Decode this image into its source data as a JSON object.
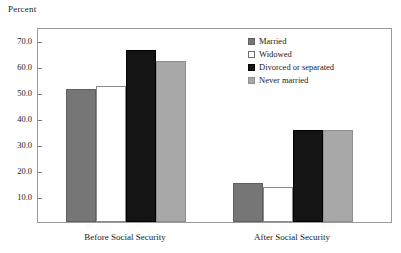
{
  "chart_data": {
    "type": "bar",
    "title": "",
    "xlabel": "",
    "ylabel": "Percent",
    "ylim": [
      0,
      75
    ],
    "yticks": [
      "10.0",
      "20.0",
      "30.0",
      "40.0",
      "50.0",
      "60.0",
      "70.0"
    ],
    "ytick_values": [
      10,
      20,
      30,
      40,
      50,
      60,
      70
    ],
    "grid": false,
    "legend_position": "top-right",
    "categories": [
      "Before Social Security",
      "After Social Security"
    ],
    "series": [
      {
        "name": "Married",
        "color": "#767676",
        "values": [
          51.3,
          15.0
        ]
      },
      {
        "name": "Widowed",
        "color": "#ffffff",
        "values": [
          52.5,
          13.5
        ]
      },
      {
        "name": "Divorced or separated",
        "color": "#141414",
        "values": [
          66.0,
          35.5
        ]
      },
      {
        "name": "Never married",
        "color": "#a8a8a8",
        "values": [
          62.0,
          35.5
        ]
      }
    ]
  },
  "axis": {
    "y_title": "Percent"
  },
  "legend": {
    "items": [
      {
        "label": "Married",
        "key": "married"
      },
      {
        "label": "Widowed",
        "key": "widowed"
      },
      {
        "label": "Divorced or separated",
        "key": "divorced"
      },
      {
        "label": "Never married",
        "key": "never"
      }
    ]
  }
}
